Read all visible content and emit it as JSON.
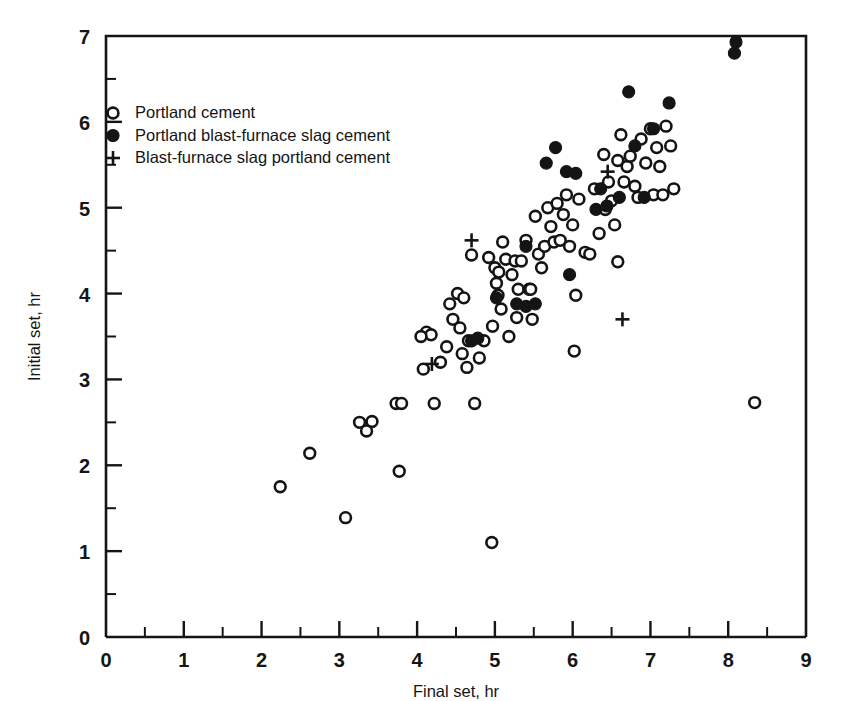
{
  "chart_data": {
    "type": "scatter",
    "title": "",
    "xlabel": "Final set, hr",
    "ylabel": "Initial set, hr",
    "xlim": [
      0,
      9
    ],
    "ylim": [
      0,
      7
    ],
    "xticks": [
      0,
      1,
      2,
      3,
      4,
      5,
      6,
      7,
      8,
      9
    ],
    "xtick_labels": [
      "0",
      "1",
      "2",
      "3",
      "4",
      "5",
      "6",
      "7",
      "8",
      "9"
    ],
    "xminor_step": 0.5,
    "yticks": [
      0,
      1,
      2,
      3,
      4,
      5,
      6,
      7
    ],
    "ytick_labels": [
      "0",
      "1",
      "2",
      "3",
      "4",
      "5",
      "6",
      "7"
    ],
    "yminor_step": 0.5,
    "grid": false,
    "legend_position": "upper-left-inside",
    "series": [
      {
        "name": "Portland cement",
        "marker": "open-circle",
        "color": "#141414",
        "points": [
          [
            2.24,
            1.75
          ],
          [
            2.62,
            2.14
          ],
          [
            3.08,
            1.39
          ],
          [
            3.26,
            2.5
          ],
          [
            3.35,
            2.4
          ],
          [
            3.42,
            2.51
          ],
          [
            3.77,
            1.93
          ],
          [
            3.73,
            2.72
          ],
          [
            3.8,
            2.72
          ],
          [
            4.08,
            3.12
          ],
          [
            4.12,
            3.55
          ],
          [
            4.18,
            3.52
          ],
          [
            4.22,
            2.72
          ],
          [
            4.3,
            3.2
          ],
          [
            4.38,
            3.38
          ],
          [
            4.42,
            3.88
          ],
          [
            4.46,
            3.7
          ],
          [
            4.52,
            4.0
          ],
          [
            4.55,
            3.6
          ],
          [
            4.58,
            3.3
          ],
          [
            4.6,
            3.95
          ],
          [
            4.64,
            3.14
          ],
          [
            4.66,
            3.45
          ],
          [
            4.7,
            4.45
          ],
          [
            4.74,
            2.72
          ],
          [
            4.8,
            3.25
          ],
          [
            4.86,
            3.45
          ],
          [
            4.96,
            1.1
          ],
          [
            4.97,
            3.62
          ],
          [
            5.0,
            4.3
          ],
          [
            5.02,
            4.12
          ],
          [
            5.04,
            3.98
          ],
          [
            5.05,
            4.25
          ],
          [
            5.08,
            3.82
          ],
          [
            5.1,
            4.6
          ],
          [
            5.14,
            4.4
          ],
          [
            5.18,
            3.5
          ],
          [
            5.22,
            4.22
          ],
          [
            5.26,
            4.38
          ],
          [
            5.28,
            3.72
          ],
          [
            5.3,
            4.05
          ],
          [
            5.34,
            4.38
          ],
          [
            5.4,
            4.62
          ],
          [
            5.44,
            4.05
          ],
          [
            5.48,
            3.7
          ],
          [
            5.52,
            4.9
          ],
          [
            5.56,
            4.46
          ],
          [
            5.6,
            4.3
          ],
          [
            5.64,
            4.55
          ],
          [
            5.68,
            5.0
          ],
          [
            5.72,
            4.78
          ],
          [
            5.76,
            4.6
          ],
          [
            5.8,
            5.05
          ],
          [
            5.84,
            4.62
          ],
          [
            5.88,
            4.92
          ],
          [
            5.92,
            5.15
          ],
          [
            5.96,
            4.55
          ],
          [
            6.0,
            4.8
          ],
          [
            6.04,
            3.98
          ],
          [
            6.08,
            5.1
          ],
          [
            6.16,
            4.48
          ],
          [
            6.22,
            4.46
          ],
          [
            6.28,
            5.22
          ],
          [
            6.34,
            4.7
          ],
          [
            6.4,
            5.62
          ],
          [
            6.42,
            4.98
          ],
          [
            6.46,
            5.3
          ],
          [
            6.5,
            5.08
          ],
          [
            6.54,
            4.8
          ],
          [
            6.58,
            5.55
          ],
          [
            6.62,
            5.85
          ],
          [
            6.66,
            5.3
          ],
          [
            6.7,
            5.48
          ],
          [
            6.74,
            5.6
          ],
          [
            6.8,
            5.25
          ],
          [
            6.84,
            5.12
          ],
          [
            6.88,
            5.8
          ],
          [
            6.94,
            5.52
          ],
          [
            7.0,
            5.92
          ],
          [
            7.04,
            5.15
          ],
          [
            7.08,
            5.7
          ],
          [
            7.12,
            5.48
          ],
          [
            7.16,
            5.15
          ],
          [
            7.2,
            5.95
          ],
          [
            7.26,
            5.72
          ],
          [
            7.3,
            5.22
          ],
          [
            6.02,
            3.33
          ],
          [
            6.58,
            4.37
          ],
          [
            8.34,
            2.73
          ],
          [
            4.05,
            3.5
          ],
          [
            4.92,
            4.42
          ],
          [
            5.46,
            4.05
          ]
        ]
      },
      {
        "name": "Portland blast-furnace slag cement",
        "marker": "filled-circle",
        "color": "#141414",
        "points": [
          [
            4.7,
            3.45
          ],
          [
            4.78,
            3.48
          ],
          [
            5.02,
            3.95
          ],
          [
            5.28,
            3.88
          ],
          [
            5.4,
            3.85
          ],
          [
            5.52,
            3.88
          ],
          [
            5.66,
            5.52
          ],
          [
            5.78,
            5.7
          ],
          [
            5.92,
            5.42
          ],
          [
            5.96,
            4.22
          ],
          [
            6.04,
            5.4
          ],
          [
            6.3,
            4.98
          ],
          [
            6.36,
            5.22
          ],
          [
            6.44,
            5.02
          ],
          [
            6.6,
            5.12
          ],
          [
            6.72,
            6.35
          ],
          [
            6.8,
            5.72
          ],
          [
            6.92,
            5.12
          ],
          [
            7.04,
            5.92
          ],
          [
            7.24,
            6.22
          ],
          [
            8.1,
            6.93
          ],
          [
            8.08,
            6.8
          ],
          [
            5.4,
            4.55
          ]
        ]
      },
      {
        "name": "Blast-furnace slag portland cement",
        "marker": "plus",
        "color": "#141414",
        "points": [
          [
            4.19,
            3.18
          ],
          [
            4.7,
            4.62
          ],
          [
            6.45,
            5.42
          ],
          [
            6.64,
            3.7
          ]
        ]
      }
    ]
  },
  "legend": {
    "entries": [
      {
        "marker": "open-circle",
        "label": "Portland cement"
      },
      {
        "marker": "filled-circle",
        "label": "Portland blast-furnace slag cement"
      },
      {
        "marker": "plus",
        "label": "Blast-furnace slag portland cement"
      }
    ]
  },
  "colors": {
    "ink": "#141414",
    "background": "#ffffff"
  }
}
